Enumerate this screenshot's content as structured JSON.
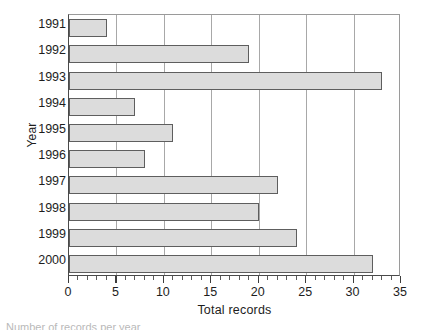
{
  "chart_data": {
    "type": "bar",
    "orientation": "horizontal",
    "title": "",
    "xlabel": "Total records",
    "ylabel": "Year",
    "categories": [
      "1991",
      "1992",
      "1993",
      "1994",
      "1995",
      "1996",
      "1997",
      "1998",
      "1999",
      "2000"
    ],
    "values": [
      4,
      19,
      33,
      7,
      11,
      8,
      22,
      20,
      24,
      32
    ],
    "xlim": [
      0,
      35
    ],
    "xticks": [
      0,
      5,
      10,
      15,
      20,
      25,
      30,
      35
    ],
    "xtick_labels": [
      "0",
      "5",
      "10",
      "15",
      "20",
      "25",
      "30",
      "35"
    ],
    "minor_tick_interval": 1,
    "grid": "vertical-major",
    "legend": "none",
    "bar_fill": "#dcdcdc",
    "bar_edge": "#5e5e5e",
    "gridline_color": "#a8a8a8",
    "axis_color": "#3d3d3d",
    "series": [
      {
        "name": "Total records",
        "values": [
          4,
          19,
          33,
          7,
          11,
          8,
          22,
          20,
          24,
          32
        ]
      }
    ]
  },
  "caption_sliver": "Number of records per year"
}
